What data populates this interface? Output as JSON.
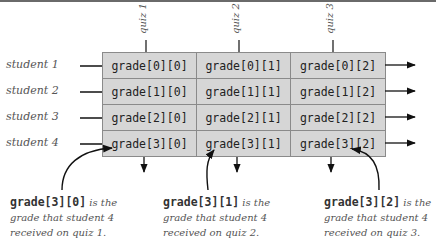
{
  "diagram": {
    "quizzes": [
      "quiz 1",
      "quiz 2",
      "quiz 3"
    ],
    "students": [
      "student 1",
      "student 2",
      "student 3",
      "student 4"
    ],
    "cells": [
      [
        "grade[0][0]",
        "grade[0][1]",
        "grade[0][2]"
      ],
      [
        "grade[1][0]",
        "grade[1][1]",
        "grade[1][2]"
      ],
      [
        "grade[2][0]",
        "grade[2][1]",
        "grade[2][2]"
      ],
      [
        "grade[3][0]",
        "grade[3][1]",
        "grade[3][2]"
      ]
    ],
    "notes": [
      {
        "code": "grade[3][0]",
        "line1": " is the",
        "line2": "grade that student 4",
        "line3": "received on quiz 1."
      },
      {
        "code": "grade[3][1]",
        "line1": " is the",
        "line2": "grade that student 4",
        "line3": "received on quiz 2."
      },
      {
        "code": "grade[3][2]",
        "line1": " is the",
        "line2": "grade that student 4",
        "line3": "received on quiz 3."
      }
    ],
    "colors": {
      "cell_fill": "#d6d6d6",
      "border": "#8a8a8a",
      "label_text": "#555555"
    }
  }
}
